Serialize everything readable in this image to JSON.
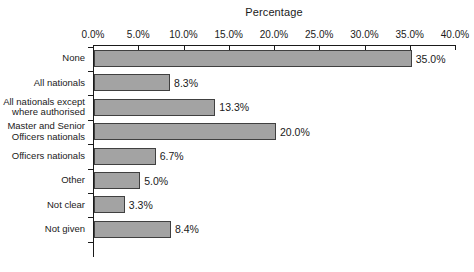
{
  "chart_data": {
    "type": "bar",
    "orientation": "horizontal",
    "title": "Percentage",
    "xlabel": "Percentage",
    "ylabel": "",
    "xlim": [
      0,
      40
    ],
    "xticks": [
      "0.0%",
      "5.0%",
      "10.0%",
      "15.0%",
      "20.0%",
      "25.0%",
      "30.0%",
      "35.0%",
      "40.0%"
    ],
    "xtick_values": [
      0,
      5,
      10,
      15,
      20,
      25,
      30,
      35,
      40
    ],
    "grid": false,
    "legend": false,
    "categories": [
      "None",
      "All nationals",
      "All nationals except\nwhere authorised",
      "Master and Senior\nOfficers nationals",
      "Officers nationals",
      "Other",
      "Not clear",
      "Not given"
    ],
    "values": [
      35.0,
      8.3,
      13.3,
      20.0,
      6.7,
      5.0,
      3.3,
      8.4
    ],
    "value_labels": [
      "35.0%",
      "8.3%",
      "13.3%",
      "20.0%",
      "6.7%",
      "5.0%",
      "3.3%",
      "8.4%"
    ],
    "colors": {
      "bar_fill": "#a3a3a3",
      "bar_border": "#404040",
      "axis": "#1a1a1a",
      "text": "#1a1a1a",
      "background": "#ffffff"
    }
  }
}
